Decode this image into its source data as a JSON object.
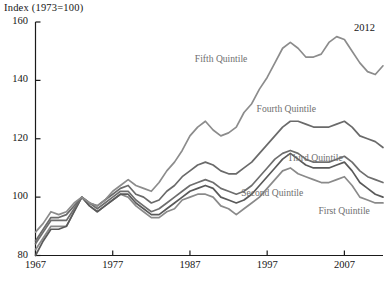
{
  "chart_data": {
    "type": "line",
    "title": "Index (1973=100)",
    "xlabel": "",
    "ylabel": "Index (1973=100)",
    "xlim": [
      1967,
      2012
    ],
    "ylim": [
      80,
      160
    ],
    "yticks": [
      80,
      100,
      120,
      140,
      160
    ],
    "xticks": [
      1967,
      1977,
      1987,
      1997,
      2007
    ],
    "grid": false,
    "legend_position": "inline-annotations",
    "end_year_annotation": "2012",
    "x": [
      1967,
      1968,
      1969,
      1970,
      1971,
      1972,
      1973,
      1974,
      1975,
      1976,
      1977,
      1978,
      1979,
      1980,
      1981,
      1982,
      1983,
      1984,
      1985,
      1986,
      1987,
      1988,
      1989,
      1990,
      1991,
      1992,
      1993,
      1994,
      1995,
      1996,
      1997,
      1998,
      1999,
      2000,
      2001,
      2002,
      2003,
      2004,
      2005,
      2006,
      2007,
      2008,
      2009,
      2010,
      2011,
      2012
    ],
    "series": [
      {
        "name": "First Quintile",
        "color": "#8a8a8a",
        "label_x": 2007,
        "label_y": 95,
        "values": [
          82,
          86,
          90,
          90,
          90,
          95,
          100,
          97,
          95,
          97,
          99,
          101,
          100,
          97,
          95,
          93,
          93,
          95,
          96,
          99,
          100,
          101,
          101,
          100,
          97,
          96,
          94,
          96,
          98,
          100,
          103,
          106,
          109,
          110,
          108,
          107,
          106,
          105,
          105,
          106,
          107,
          104,
          100,
          99,
          98,
          98
        ]
      },
      {
        "name": "Second Quintile",
        "color": "#5a5a5a",
        "label_x": 1997,
        "label_y": 101,
        "values": [
          80,
          85,
          89,
          89,
          90,
          95,
          100,
          97,
          95,
          97,
          99,
          101,
          101,
          98,
          96,
          94,
          94,
          96,
          98,
          100,
          102,
          103,
          104,
          103,
          100,
          99,
          98,
          99,
          101,
          104,
          107,
          110,
          113,
          115,
          113,
          111,
          110,
          110,
          110,
          111,
          112,
          109,
          105,
          103,
          101,
          100
        ]
      },
      {
        "name": "Third Quintile",
        "color": "#6e6e6e",
        "label_x": 2003,
        "label_y": 113,
        "values": [
          84,
          88,
          92,
          92,
          92,
          96,
          100,
          98,
          96,
          98,
          100,
          102,
          102,
          99,
          97,
          95,
          96,
          98,
          100,
          102,
          104,
          105,
          106,
          105,
          103,
          102,
          101,
          102,
          104,
          107,
          110,
          113,
          115,
          116,
          115,
          113,
          112,
          112,
          112,
          113,
          114,
          112,
          109,
          107,
          106,
          105
        ]
      },
      {
        "name": "Fourth Quintile",
        "color": "#6a6a6a",
        "label_x": 1999,
        "label_y": 130,
        "values": [
          85,
          89,
          93,
          93,
          94,
          97,
          100,
          98,
          97,
          99,
          101,
          103,
          104,
          101,
          100,
          98,
          99,
          102,
          104,
          107,
          109,
          111,
          112,
          111,
          109,
          108,
          108,
          110,
          112,
          115,
          118,
          121,
          124,
          126,
          126,
          125,
          124,
          124,
          124,
          125,
          126,
          124,
          121,
          120,
          119,
          117
        ]
      },
      {
        "name": "Fifth Quintile",
        "color": "#8c8c8c",
        "label_x": 1991,
        "label_y": 147,
        "values": [
          88,
          91,
          95,
          94,
          95,
          98,
          100,
          98,
          97,
          99,
          102,
          104,
          106,
          104,
          103,
          102,
          105,
          109,
          112,
          116,
          121,
          124,
          126,
          123,
          121,
          122,
          124,
          129,
          132,
          137,
          141,
          146,
          151,
          153,
          151,
          148,
          148,
          149,
          153,
          155,
          154,
          150,
          146,
          143,
          142,
          145
        ]
      }
    ]
  }
}
